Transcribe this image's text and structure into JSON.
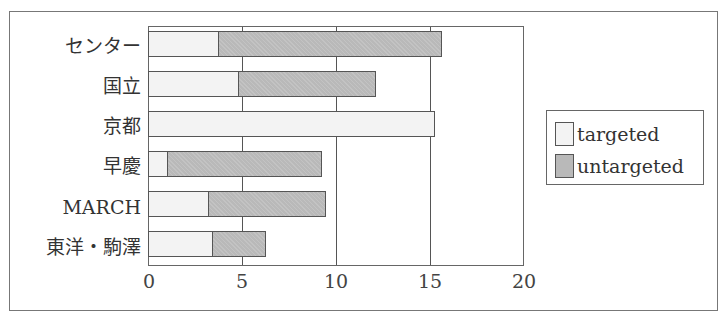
{
  "chart_data": {
    "type": "bar",
    "orientation": "horizontal",
    "stacked": true,
    "title": "",
    "xlabel": "",
    "ylabel": "",
    "xlim": [
      0,
      20
    ],
    "xticks": [
      0,
      5,
      10,
      15,
      20
    ],
    "grid": "vertical",
    "legend_position": "right",
    "categories": [
      "センター",
      "国立",
      "京都",
      "早慶",
      "MARCH",
      "東洋・駒澤"
    ],
    "series": [
      {
        "name": "targeted",
        "color": "#f3f3f3",
        "values": [
          3.7,
          4.8,
          15.2,
          1.0,
          3.2,
          3.4
        ]
      },
      {
        "name": "untargeted",
        "color": "#b9b9b9",
        "values": [
          11.9,
          7.3,
          0,
          8.2,
          6.2,
          2.8
        ]
      }
    ],
    "totals": [
      15.6,
      12.1,
      15.2,
      9.2,
      9.4,
      6.2
    ]
  },
  "axis": {
    "x_ticks": [
      "0",
      "5",
      "10",
      "15",
      "20"
    ],
    "y_labels": [
      "センター",
      "国立",
      "京都",
      "早慶",
      "MARCH",
      "東洋・駒澤"
    ]
  },
  "legend": {
    "items": [
      {
        "label": "targeted",
        "color": "#f3f3f3"
      },
      {
        "label": "untargeted",
        "color": "#b9b9b9"
      }
    ]
  }
}
